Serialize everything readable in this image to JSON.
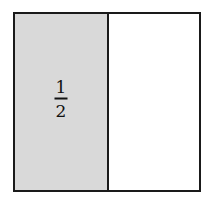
{
  "diagram": {
    "type": "fraction-area-model",
    "parts": 2,
    "shaded_parts": 1,
    "colors": {
      "shaded": "#d9d9d9",
      "unshaded": "#ffffff",
      "stroke": "#1a1a1a"
    },
    "label": {
      "numerator": "1",
      "denominator": "2"
    }
  }
}
